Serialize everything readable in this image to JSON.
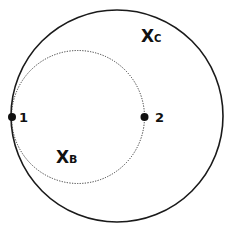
{
  "diagram": {
    "outer_set": {
      "label_main": "X",
      "label_sub": "C",
      "style": "solid"
    },
    "inner_set": {
      "label_main": "X",
      "label_sub": "B",
      "style": "dotted"
    },
    "points": [
      {
        "label": "1"
      },
      {
        "label": "2"
      }
    ],
    "colors": {
      "stroke": "#1a1a1a",
      "background": "#ffffff"
    }
  }
}
